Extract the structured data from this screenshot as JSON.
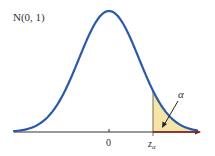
{
  "chart_data": {
    "type": "line",
    "title": "N(0, 1)",
    "distribution": "standard normal",
    "mean": 0,
    "sd": 1,
    "xlabel": "",
    "ylabel": "",
    "x_ticks": [
      {
        "value": 0,
        "label": "0"
      },
      {
        "value": 1.3,
        "label": "z_α"
      }
    ],
    "shaded_region": {
      "from": "z_α",
      "to": "+∞",
      "label": "α",
      "fill": "#f5e6a8"
    },
    "annotations": [
      {
        "text": "α",
        "points_to": "shaded right tail"
      }
    ],
    "xlim": [
      -3.5,
      3.5
    ],
    "grid": false,
    "legend": null
  },
  "labels": {
    "title": "N(0, 1)",
    "tick_zero": "0",
    "tick_z": "z",
    "tick_z_sub": "α",
    "alpha": "α"
  },
  "colors": {
    "curve": "#2a5aa8",
    "axis": "#333333",
    "shade": "#f5e6a8",
    "axis_arrow": "#8b1a1a"
  }
}
